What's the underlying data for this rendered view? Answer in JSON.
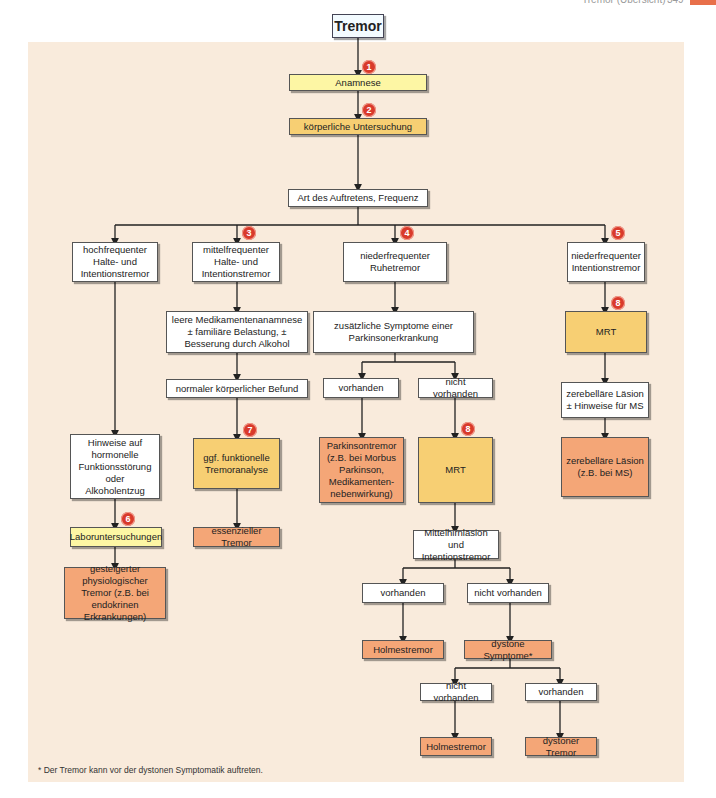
{
  "header": {
    "title": "Tremor (Übersicht)",
    "page_number": "349",
    "accent_color": "#e8704a"
  },
  "colors": {
    "background_panel": "#f9ebdc",
    "box_white": "#ffffff",
    "box_yellow": "#fdf6a4",
    "box_amber": "#f7cf73",
    "box_salmon": "#f4a677",
    "badge": "#d93a2b"
  },
  "nodes": {
    "root": "Tremor",
    "anamnese": "Anamnese",
    "koerperlich": "körperliche Untersuchung",
    "art": "Art des Auftretens, Frequenz",
    "hochfrequent": "hochfrequenter Halte- und Intentionstremor",
    "mittelfrequent": "mittelfrequenter Halte- und Intentionstremor",
    "niederfrequent_ruhe": "niederfrequenter Ruhetremor",
    "niederfrequent_intention": "niederfrequenter Intentionstremor",
    "leere_medikamente": "leere Medikamentenanamnese ± familiäre Belastung, ± Besserung durch Alkohol",
    "normaler_befund": "normaler körperlicher Befund",
    "tremoranalyse": "ggf. funktionelle Tremoranalyse",
    "essenzieller": "essenzieller Tremor",
    "hinweise_hormonell": "Hinweise auf hormonelle Funktionsstörung oder Alkoholentzug",
    "labor": "Laboruntersuchungen",
    "gesteigerter": "gesteigerter physiologischer Tremor (z.B. bei endokrinen Erkrankungen)",
    "zusaetzliche": "zusätzliche Symptome einer Parkinsonerkrankung",
    "vorhanden_1": "vorhanden",
    "nicht_vorhanden_1": "nicht vorhanden",
    "parkinsontremor": "Parkinsontremor (z.B. bei Morbus Parkinson, Medikamenten-nebenwirkung)",
    "mrt_mid": "MRT",
    "mittelhirn": "Mittelhirnläsion und Intentionstremor",
    "vorhanden_2": "vorhanden",
    "nicht_vorhanden_2": "nicht vorhanden",
    "holmes_1": "Holmestremor",
    "dystone": "dystone Symptome*",
    "nicht_vorhanden_3": "nicht vorhanden",
    "vorhanden_3": "vorhanden",
    "holmes_2": "Holmestremor",
    "dystoner": "dystoner Tremor",
    "mrt_right": "MRT",
    "zerebellaer_hinweis": "zerebelläre Läsion ± Hinweise für MS",
    "zerebellaer_ms": "zerebelläre Läsion (z.B. bei MS)"
  },
  "badges": {
    "b1": "1",
    "b2": "2",
    "b3": "3",
    "b4": "4",
    "b5": "5",
    "b6": "6",
    "b7": "7",
    "b8a": "8",
    "b8b": "8"
  },
  "footnote": "* Der Tremor kann vor der dystonen Symptomatik auftreten."
}
